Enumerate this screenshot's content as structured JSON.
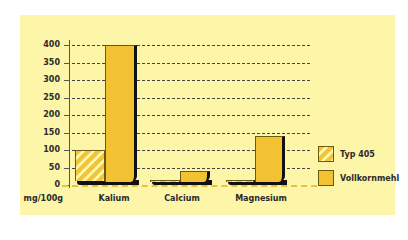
{
  "chart_data": {
    "type": "bar",
    "title": "",
    "xlabel": "",
    "ylabel": "mg/100g",
    "ylim": [
      0,
      400
    ],
    "yticks": [
      0,
      50,
      100,
      150,
      200,
      250,
      300,
      350,
      400
    ],
    "grid": true,
    "legend_position": "right",
    "categories": [
      "Kalium",
      "Calcium",
      "Magnesium"
    ],
    "series": [
      {
        "name": "Typ 405",
        "values": [
          100,
          15,
          15
        ],
        "pattern": "hatched",
        "color": "#f0c53b"
      },
      {
        "name": "Vollkornmehl",
        "values": [
          400,
          40,
          140
        ],
        "pattern": "solid",
        "color": "#f2c232"
      }
    ]
  },
  "axis": {
    "unit_label": "mg/100g",
    "ticks": [
      "0",
      "50",
      "100",
      "150",
      "200",
      "250",
      "300",
      "350",
      "400"
    ]
  },
  "categories": [
    "Kalium",
    "Calcium",
    "Magnesium"
  ],
  "legend": [
    {
      "label": "Typ 405"
    },
    {
      "label": "Vollkornmehl"
    }
  ],
  "colors": {
    "background": "#fdf6a8",
    "bar": "#f2c232",
    "shadow": "#111111"
  }
}
